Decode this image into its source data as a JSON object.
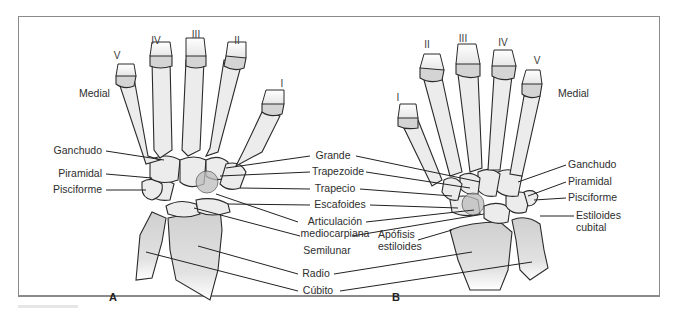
{
  "figure": {
    "panels": [
      {
        "id": "A",
        "label": "A",
        "orientation_label": "Medial",
        "digits": [
          "V",
          "IV",
          "III",
          "II",
          "I"
        ],
        "left_labels": [
          "Ganchudo",
          "Piramidal",
          "Pisciforme"
        ]
      },
      {
        "id": "B",
        "label": "B",
        "orientation_label": "Medial",
        "digits": [
          "I",
          "II",
          "III",
          "IV",
          "V"
        ],
        "right_labels": [
          "Ganchudo",
          "Piramidal",
          "Pisciforme",
          "Estiloides cubital"
        ],
        "left_labels": [
          "Apófisis estiloides"
        ]
      }
    ],
    "center_labels": {
      "grande": "Grande",
      "trapezoide": "Trapezoide",
      "trapecio": "Trapecio",
      "escafoides": "Escafoides",
      "articulacion_line1": "Articulación",
      "articulacion_line2": "mediocarpiana",
      "semilunar": "Semilunar",
      "radio": "Radio",
      "cubito": "Cúbito"
    },
    "panel_b_labels": {
      "ganchudo": "Ganchudo",
      "piramidal": "Piramidal",
      "pisciforme": "Pisciforme",
      "estiloides_line1": "Estiloides",
      "estiloides_line2": "cubital",
      "apofisis_line1": "Apófisis",
      "apofisis_line2": "estiloides"
    },
    "panel_a_labels": {
      "ganchudo": "Ganchudo",
      "piramidal": "Piramidal",
      "pisciforme": "Pisciforme"
    },
    "colors": {
      "bone_fill": "#ececec",
      "joint_fill": "#d4d4d4",
      "forearm_shade": "#cfcfcf",
      "line": "#222222",
      "frame": "#8a8a8a"
    }
  }
}
